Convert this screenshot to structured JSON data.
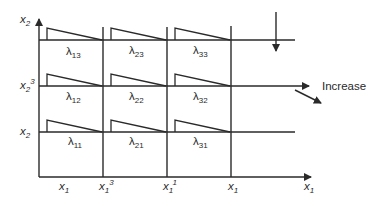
{
  "diagram": {
    "y_axis_label": {
      "base": "x",
      "sub": "2"
    },
    "x_axis_label": {
      "base": "x",
      "sub": "1"
    },
    "row_labels": [
      {
        "base": "x",
        "sub": "2",
        "sup": "3"
      },
      {
        "base": "x",
        "sub": "2",
        "sup": ""
      }
    ],
    "column_labels": [
      {
        "base": "x",
        "sub": "1",
        "sup": ""
      },
      {
        "base": "x",
        "sub": "1",
        "sup": "3"
      },
      {
        "base": "x",
        "sub": "1",
        "sup": "1"
      },
      {
        "base": "x",
        "sub": "1",
        "sup": ""
      }
    ],
    "cells": [
      {
        "id": "13",
        "label": "λ",
        "sub": "13"
      },
      {
        "id": "23",
        "label": "λ",
        "sub": "23"
      },
      {
        "id": "33",
        "label": "λ",
        "sub": "33"
      },
      {
        "id": "12",
        "label": "λ",
        "sub": "12"
      },
      {
        "id": "22",
        "label": "λ",
        "sub": "22"
      },
      {
        "id": "32",
        "label": "λ",
        "sub": "32"
      },
      {
        "id": "11",
        "label": "λ",
        "sub": "11"
      },
      {
        "id": "21",
        "label": "λ",
        "sub": "21"
      },
      {
        "id": "31",
        "label": "λ",
        "sub": "31"
      }
    ],
    "annotation": "Increase",
    "colors": {
      "ink": "#2a2a2a",
      "background": "#ffffff"
    }
  }
}
